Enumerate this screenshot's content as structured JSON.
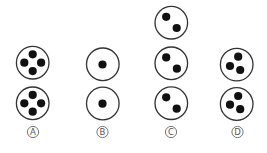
{
  "diagram": {
    "type": "multiple-choice-figure-options",
    "colors": {
      "background": "#ffffff",
      "circle_stroke": "#333333",
      "dot_fill": "#111111",
      "label_color": "#555555"
    },
    "options": [
      {
        "label": "A",
        "label_pos": [
          33,
          132
        ],
        "figures": [
          {
            "cx": 32.7,
            "cy": 62.7,
            "r": 16.3,
            "dots": [
              [
                32.7,
                54.3
              ],
              [
                24.3,
                62.7
              ],
              [
                41.1,
                62.7
              ],
              [
                32.7,
                71.1
              ]
            ]
          },
          {
            "cx": 32.7,
            "cy": 103.3,
            "r": 16.3,
            "dots": [
              [
                32.7,
                94.9
              ],
              [
                24.3,
                103.3
              ],
              [
                41.1,
                103.3
              ],
              [
                32.7,
                111.7
              ]
            ]
          }
        ]
      },
      {
        "label": "B",
        "label_pos": [
          102.5,
          132
        ],
        "figures": [
          {
            "cx": 102.8,
            "cy": 64.3,
            "r": 16.3,
            "dots": [
              [
                102.5,
                64.5
              ]
            ]
          },
          {
            "cx": 102.8,
            "cy": 103.5,
            "r": 16.3,
            "dots": [
              [
                102.5,
                103.7
              ]
            ]
          }
        ]
      },
      {
        "label": "C",
        "label_pos": [
          171,
          132
        ],
        "figures": [
          {
            "cx": 171.3,
            "cy": 22.7,
            "r": 16.3,
            "dots": [
              [
                166.2,
                16.8
              ],
              [
                176.7,
                28.0
              ]
            ]
          },
          {
            "cx": 171.3,
            "cy": 63.3,
            "r": 16.3,
            "dots": [
              [
                166.2,
                57.4
              ],
              [
                176.9,
                68.7
              ]
            ]
          },
          {
            "cx": 171.3,
            "cy": 103.2,
            "r": 16.3,
            "dots": [
              [
                166.2,
                97.3
              ],
              [
                176.7,
                108.7
              ]
            ]
          }
        ]
      },
      {
        "label": "D",
        "label_pos": [
          237.5,
          132
        ],
        "figures": [
          {
            "cx": 236.7,
            "cy": 64.6,
            "r": 16.3,
            "dots": [
              [
                238.2,
                56.7
              ],
              [
                230.0,
                66.0
              ],
              [
                240.2,
                70.0
              ]
            ]
          },
          {
            "cx": 236.7,
            "cy": 104.0,
            "r": 16.3,
            "dots": [
              [
                238.2,
                96.0
              ],
              [
                230.0,
                104.7
              ],
              [
                240.2,
                109.2
              ]
            ]
          }
        ]
      }
    ]
  }
}
